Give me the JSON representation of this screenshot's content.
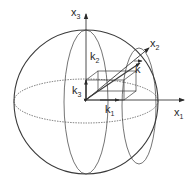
{
  "diagram": {
    "type": "3d-coordinate-sphere",
    "axes": [
      {
        "id": "x1",
        "base": "x",
        "sub": "1"
      },
      {
        "id": "x2",
        "base": "x",
        "sub": "2"
      },
      {
        "id": "x3",
        "base": "x",
        "sub": "3"
      }
    ],
    "components": [
      {
        "id": "k1",
        "base": "k",
        "sub": "1"
      },
      {
        "id": "k2",
        "base": "k",
        "sub": "2"
      },
      {
        "id": "k3",
        "base": "k",
        "sub": "3"
      }
    ],
    "vector": {
      "id": "k",
      "base": "k",
      "accent": "→"
    },
    "colors": {
      "stroke": "#3a3a3a",
      "text": "#2a2a2a",
      "background": "#ffffff"
    }
  }
}
